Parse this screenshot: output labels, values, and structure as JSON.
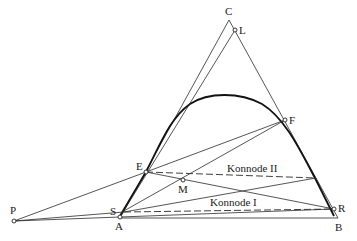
{
  "diagram": {
    "type": "ternary-extraction-diagram",
    "colors": {
      "line": "#2a2a2a",
      "curve": "#111111",
      "background": "#ffffff"
    },
    "vertex_labels": {
      "C": "C",
      "A": "A",
      "B": "B"
    },
    "point_labels": {
      "L": "L",
      "F": "F",
      "E": "E",
      "M": "M",
      "P": "P",
      "S": "S",
      "R": "R"
    },
    "tie_lines": {
      "konnode_1": "Konnode I",
      "konnode_2": "Konnode II"
    }
  }
}
